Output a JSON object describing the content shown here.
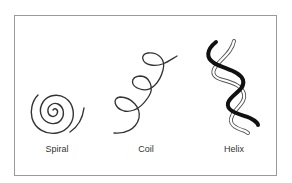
{
  "diagram": {
    "items": [
      {
        "label": "Spiral",
        "shape": "spiral-icon"
      },
      {
        "label": "Coil",
        "shape": "coil-icon"
      },
      {
        "label": "Helix",
        "shape": "helix-icon"
      }
    ],
    "colors": {
      "stroke": "#333333",
      "helix_dark": "#111111",
      "border": "#9a9a9a"
    }
  }
}
